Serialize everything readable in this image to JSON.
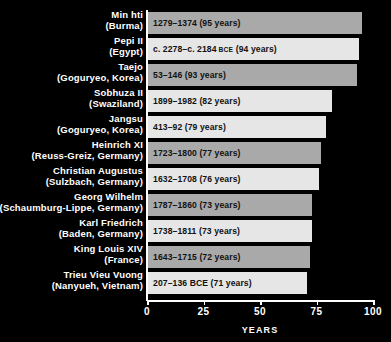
{
  "chart_data": {
    "type": "bar",
    "orientation": "horizontal",
    "title": "",
    "xlabel": "YEARS",
    "ylabel": "",
    "xlim": [
      0,
      100
    ],
    "xticks": [
      0,
      25,
      50,
      75,
      100
    ],
    "xtick_labels": [
      "0",
      "25",
      "50",
      "75",
      "100"
    ],
    "grid": false,
    "legend": "none",
    "background_color": "#000000",
    "text_color": "#ffffff",
    "bar_colors": [
      "#a9a9a9",
      "#e6e6e6"
    ],
    "categories": [
      "Min hti (Burma)",
      "Pepi II (Egypt)",
      "Taejo (Goguryeo, Korea)",
      "Sobhuza II (Swaziland)",
      "Jangsu (Goguryeo, Korea)",
      "Heinrich XI (Reuss-Greiz, Germany)",
      "Christian Augustus (Sulzbach, Germany)",
      "Georg Wilhelm (Schaumburg-Lippe, Germany)",
      "Karl Friedrich (Baden, Germany)",
      "King Louis XIV (France)",
      "Trieu Vieu Vuong (Nanyueh, Vietnam)"
    ],
    "values": [
      95,
      94,
      93,
      82,
      79,
      77,
      76,
      73,
      73,
      72,
      71
    ]
  },
  "rows": [
    {
      "name_line1": "Min hti",
      "name_line2": "(Burma)",
      "reign_text": "1279–1374 (95 years)",
      "reign_prefix": "1279–1374 (95 years)",
      "era": "",
      "reign_suffix": "",
      "value": 95,
      "shade": "dark"
    },
    {
      "name_line1": "Pepi II",
      "name_line2": "(Egypt)",
      "reign_text": "c. 2278–c. 2184 BCE (94 years)",
      "reign_prefix": "c. 2278–c. 2184 ",
      "era": "BCE",
      "reign_suffix": " (94 years)",
      "value": 94,
      "shade": "light"
    },
    {
      "name_line1": "Taejo",
      "name_line2": "(Goguryeo, Korea)",
      "reign_text": "53–146 (93 years)",
      "reign_prefix": "53–146 (93 years)",
      "era": "",
      "reign_suffix": "",
      "value": 93,
      "shade": "dark"
    },
    {
      "name_line1": "Sobhuza II",
      "name_line2": "(Swaziland)",
      "reign_text": "1899–1982 (82 years)",
      "reign_prefix": "1899–1982 (82 years)",
      "era": "",
      "reign_suffix": "",
      "value": 82,
      "shade": "light"
    },
    {
      "name_line1": "Jangsu",
      "name_line2": "(Goguryeo, Korea)",
      "reign_text": "413–92 (79 years)",
      "reign_prefix": "413–92 (79 years)",
      "era": "",
      "reign_suffix": "",
      "value": 79,
      "shade": "light"
    },
    {
      "name_line1": "Heinrich XI",
      "name_line2": "(Reuss-Greiz, Germany)",
      "reign_text": "1723–1800 (77 years)",
      "reign_prefix": "1723–1800 (77 years)",
      "era": "",
      "reign_suffix": "",
      "value": 77,
      "shade": "dark"
    },
    {
      "name_line1": "Christian Augustus",
      "name_line2": "(Sulzbach, Germany)",
      "reign_text": "1632–1708 (76 years)",
      "reign_prefix": "1632–1708 (76 years)",
      "era": "",
      "reign_suffix": "",
      "value": 76,
      "shade": "light"
    },
    {
      "name_line1": "Georg Wilhelm",
      "name_line2": "(Schaumburg-Lippe, Germany)",
      "reign_text": "1787–1860 (73 years)",
      "reign_prefix": "1787–1860 (73 years)",
      "era": "",
      "reign_suffix": "",
      "value": 73,
      "shade": "dark"
    },
    {
      "name_line1": "Karl Friedrich",
      "name_line2": "(Baden, Germany)",
      "reign_text": "1738–1811 (73 years)",
      "reign_prefix": "1738–1811 (73 years)",
      "era": "",
      "reign_suffix": "",
      "value": 73,
      "shade": "light"
    },
    {
      "name_line1": "King Louis XIV",
      "name_line2": "(France)",
      "reign_text": "1643–1715 (72 years)",
      "reign_prefix": "1643–1715 (72 years)",
      "era": "",
      "reign_suffix": "",
      "value": 72,
      "shade": "dark"
    },
    {
      "name_line1": "Trieu Vieu Vuong",
      "name_line2": "(Nanyueh, Vietnam)",
      "reign_text": "207–136 BCE (71 years)",
      "reign_prefix": "207–136 BCE (71 years)",
      "era": "",
      "reign_suffix": "",
      "value": 71,
      "shade": "light"
    }
  ],
  "axis": {
    "ticks": [
      "0",
      "25",
      "50",
      "75",
      "100"
    ],
    "title": "YEARS"
  }
}
